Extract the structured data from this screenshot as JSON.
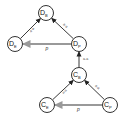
{
  "diagram": {
    "nodes": [
      {
        "id": "DB",
        "main": "D",
        "sub": "B",
        "x": 46,
        "y": 13
      },
      {
        "id": "DE",
        "main": "D",
        "sub": "E",
        "x": 15,
        "y": 44
      },
      {
        "id": "DP",
        "main": "D",
        "sub": "P",
        "x": 79,
        "y": 44
      },
      {
        "id": "CB",
        "main": "C",
        "sub": "B",
        "x": 79,
        "y": 75
      },
      {
        "id": "CE",
        "main": "C",
        "sub": "E",
        "x": 47,
        "y": 105
      },
      {
        "id": "CP",
        "main": "C",
        "sub": "P",
        "x": 110,
        "y": 105
      }
    ],
    "edges": [
      {
        "from": "DE",
        "to": "DB",
        "label": "a-a",
        "color": "#222222"
      },
      {
        "from": "DP",
        "to": "DB",
        "label": "a-a",
        "color": "#222222"
      },
      {
        "from": "DP",
        "to": "DE",
        "label": "p",
        "color": "#999999"
      },
      {
        "from": "CB",
        "to": "DP",
        "label": "a-a",
        "color": "#222222"
      },
      {
        "from": "CE",
        "to": "CB",
        "label": "a-a",
        "color": "#222222"
      },
      {
        "from": "CP",
        "to": "CB",
        "label": "a-a",
        "color": "#222222"
      },
      {
        "from": "CP",
        "to": "CE",
        "label": "p",
        "color": "#999999"
      }
    ]
  }
}
